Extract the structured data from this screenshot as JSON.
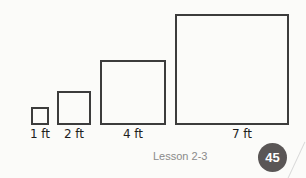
{
  "figure": {
    "squares": [
      {
        "side_label": "1 ft"
      },
      {
        "side_label": "2 ft"
      },
      {
        "side_label": "4 ft"
      },
      {
        "side_label": "7 ft"
      }
    ]
  },
  "footer": {
    "lesson": "Lesson 2-3",
    "page_number": "45"
  },
  "colors": {
    "square_stroke": "#3c3c3c",
    "badge_bg": "#5a5656",
    "lesson_text": "#8a8a8a"
  }
}
